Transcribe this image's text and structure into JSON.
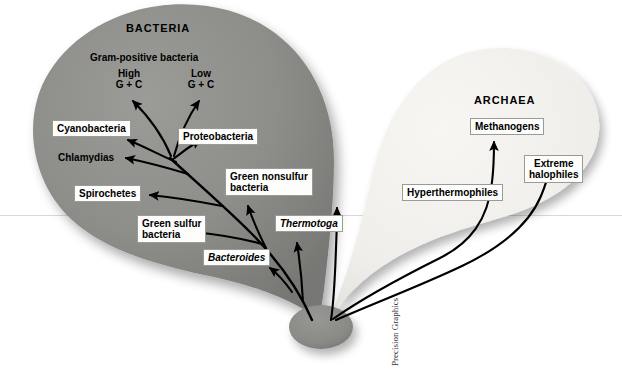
{
  "figure": {
    "type": "phylogenetic-tree",
    "credit": "Precision Graphics",
    "background_color": "#ffffff"
  },
  "domains": {
    "bacteria": {
      "title": "BACTERIA",
      "blob_color": "#8d8d8a"
    },
    "archaea": {
      "title": "ARCHAEA",
      "blob_color": "#f1f0ec"
    }
  },
  "bacteria_annotations": {
    "group_label": "Gram-positive bacteria",
    "high_gc_line1": "High",
    "high_gc_line2": "G + C",
    "low_gc_line1": "Low",
    "low_gc_line2": "G + C"
  },
  "bacteria_taxa": [
    {
      "label": "Cyanobacteria",
      "italic": false,
      "boxed": true
    },
    {
      "label": "Proteobacteria",
      "italic": false,
      "boxed": true
    },
    {
      "label": "Chlamydias",
      "italic": false,
      "boxed": false
    },
    {
      "label": "Spirochetes",
      "italic": false,
      "boxed": true
    },
    {
      "label_line1": "Green nonsulfur",
      "label_line2": "bacteria",
      "italic": false,
      "boxed": true
    },
    {
      "label_line1": "Green sulfur",
      "label_line2": "bacteria",
      "italic": false,
      "boxed": true
    },
    {
      "label": "Thermotoga",
      "italic": true,
      "boxed": true
    },
    {
      "label": "Bacteroides",
      "italic": true,
      "boxed": true
    }
  ],
  "archaea_taxa": [
    {
      "label": "Methanogens",
      "italic": false,
      "boxed": true
    },
    {
      "label_line1": "Extreme",
      "label_line2": "halophiles",
      "italic": false,
      "boxed": true
    },
    {
      "label": "Hyperthermophiles",
      "italic": false,
      "boxed": true
    }
  ]
}
